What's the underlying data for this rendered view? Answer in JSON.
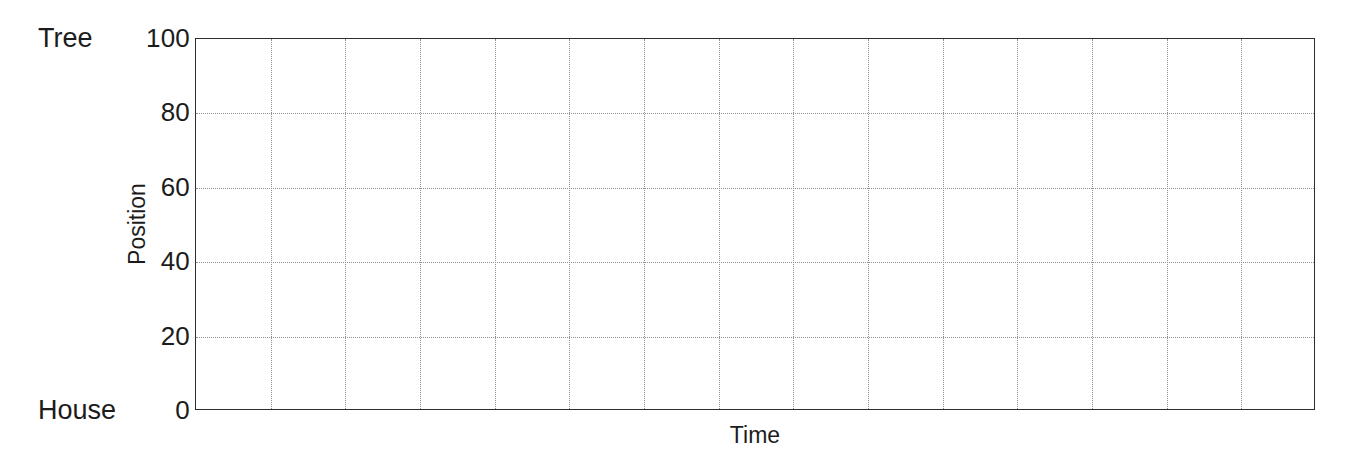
{
  "figure": {
    "name": "position-vs-time-blank-grid",
    "background_color": "#ffffff",
    "frame_color": "#2e2e2e",
    "grid_color": "#8d8d8d",
    "text_color": "#1c1c1c"
  },
  "axes": {
    "x_title": "Time",
    "y_title": "Position"
  },
  "endpoints": {
    "top_label": "Tree",
    "bottom_label": "House"
  },
  "chart_data": {
    "type": "line",
    "title": "",
    "subtitle": "",
    "xlabel": "Time",
    "ylabel": "Position",
    "x": [],
    "series": [],
    "values": [],
    "categories": [],
    "ylim": [
      0,
      100
    ],
    "xlim": [
      0,
      15
    ],
    "yticks": [
      0,
      20,
      40,
      60,
      80,
      100
    ],
    "ytick_labels": [
      "0",
      "20",
      "40",
      "60",
      "80",
      "100"
    ],
    "xticks": [],
    "xtick_labels": [],
    "y_axis_endpoint_labels": {
      "0": "House",
      "100": "Tree"
    },
    "grid": true,
    "grid_style": "dotted",
    "grid_vertical_count": 14,
    "grid_horizontal_values": [
      20,
      40,
      60,
      80
    ],
    "legend": null,
    "legend_position": "none",
    "annotations": [],
    "note": "Empty graph template: axes and dotted grid only, no plotted data."
  }
}
